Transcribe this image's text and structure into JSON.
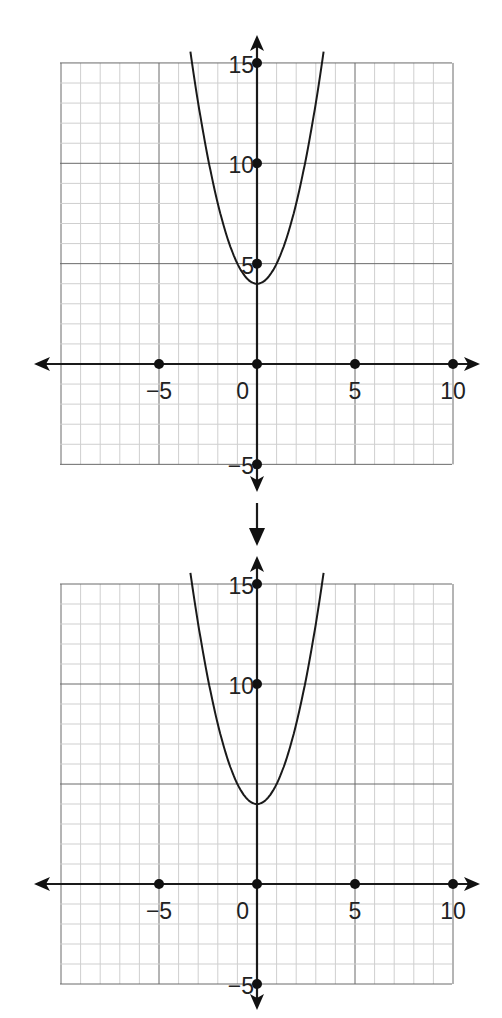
{
  "figure": {
    "colors": {
      "background": "#ffffff",
      "minor_grid": "#cfcfcf",
      "major_grid": "#6a6a6a",
      "axis": "#1a1a1a",
      "curve": "#1a1a1a"
    }
  },
  "graphs": [
    {
      "x_labels": [
        "−5",
        "0",
        "5",
        "10"
      ],
      "y_labels": [
        "15",
        "10",
        "5",
        "−5"
      ]
    },
    {
      "x_labels": [
        "−5",
        "0",
        "5",
        "10"
      ],
      "y_labels": [
        "15",
        "10",
        "−5"
      ]
    }
  ],
  "chart_data": [
    {
      "type": "line",
      "title": "",
      "xlabel": "",
      "ylabel": "",
      "xlim": [
        -10,
        10
      ],
      "ylim": [
        -5,
        15
      ],
      "grid": true,
      "grid_minor_step": 1,
      "grid_major_step": 5,
      "x_ticks": [
        -5,
        0,
        5,
        10
      ],
      "x_tick_labels": [
        "−5",
        "0",
        "5",
        "10"
      ],
      "y_ticks": [
        15,
        10,
        5,
        -5
      ],
      "y_tick_labels": [
        "15",
        "10",
        "5",
        "−5"
      ],
      "marked_points": [
        [
          -5,
          0
        ],
        [
          0,
          0
        ],
        [
          5,
          0
        ],
        [
          10,
          0
        ],
        [
          0,
          15
        ],
        [
          0,
          10
        ],
        [
          0,
          5
        ],
        [
          0,
          -5
        ]
      ],
      "series": [
        {
          "name": "y = x^2 + 4",
          "function": "x^2 + 4",
          "vertex": [
            0,
            4
          ],
          "x": [
            -3.4,
            -3,
            -2,
            -1,
            0,
            1,
            2,
            3,
            3.4
          ],
          "y": [
            15.56,
            13,
            8,
            5,
            4,
            5,
            8,
            13,
            15.56
          ]
        }
      ],
      "legend": "none"
    },
    {
      "type": "line",
      "title": "",
      "xlabel": "",
      "ylabel": "",
      "xlim": [
        -10,
        10
      ],
      "ylim": [
        -5,
        15
      ],
      "grid": true,
      "grid_minor_step": 1,
      "grid_major_step": 5,
      "x_ticks": [
        -5,
        0,
        5,
        10
      ],
      "x_tick_labels": [
        "−5",
        "0",
        "5",
        "10"
      ],
      "y_ticks": [
        15,
        10,
        -5
      ],
      "y_tick_labels": [
        "15",
        "10",
        "−5"
      ],
      "marked_points": [
        [
          -5,
          0
        ],
        [
          0,
          0
        ],
        [
          5,
          0
        ],
        [
          10,
          0
        ],
        [
          0,
          15
        ],
        [
          0,
          10
        ],
        [
          0,
          -5
        ]
      ],
      "series": [
        {
          "name": "y = x^2 + 4",
          "function": "x^2 + 4",
          "vertex": [
            0,
            4
          ],
          "x": [
            -3.4,
            -3,
            -2,
            -1,
            0,
            1,
            2,
            3,
            3.4
          ],
          "y": [
            15.56,
            13,
            8,
            5,
            4,
            5,
            8,
            13,
            15.56
          ]
        }
      ],
      "legend": "none"
    }
  ]
}
